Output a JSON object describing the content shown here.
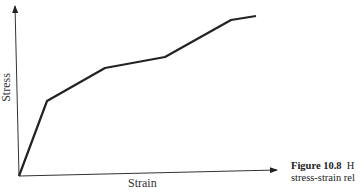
{
  "chart_data": {
    "type": "line",
    "title": "",
    "xlabel": "Strain",
    "ylabel": "Stress",
    "grid": false,
    "legend": null,
    "ticks": "none",
    "series": [
      {
        "name": "stress-strain",
        "points_px": [
          [
            19,
            176
          ],
          [
            47,
            101
          ],
          [
            105,
            68
          ],
          [
            165,
            57
          ],
          [
            231,
            20
          ],
          [
            256,
            16
          ]
        ],
        "x": [
          0,
          0.11,
          0.33,
          0.56,
          0.81,
          0.91
        ],
        "y": [
          0,
          0.44,
          0.63,
          0.7,
          0.91,
          0.94
        ]
      }
    ],
    "axes": {
      "origin": [
        19,
        176
      ],
      "y_axis_top": [
        15,
        5
      ],
      "x_axis_end": [
        277,
        170
      ]
    }
  },
  "caption": {
    "label": "Figure 10.8",
    "text_line1": "H",
    "text_line2": "stress-strain rel"
  },
  "axis_labels": {
    "x": "Strain",
    "y": "Stress"
  }
}
